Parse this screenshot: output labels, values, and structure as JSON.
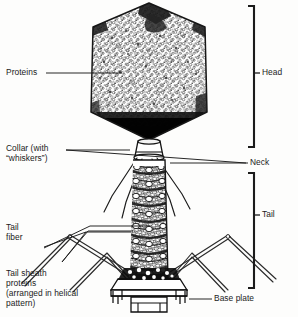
{
  "figure": {
    "style": "black-and-white stippled line drawing",
    "background_color": "#fdfdfc",
    "ink_color": "#1b1b1b"
  },
  "labels": {
    "proteins": "Proteins",
    "collar_line1": "Collar (with",
    "collar_line2": "“whiskers”)",
    "tail_fiber_line1": "Tail",
    "tail_fiber_line2": "fiber",
    "tail_sheath_line1": "Tail sheath",
    "tail_sheath_line2": "proteins",
    "tail_sheath_line3": "(arranged in helical",
    "tail_sheath_line4": "pattern)",
    "head": "Head",
    "neck": "Neck",
    "tail": "Tail",
    "base_plate": "Base plate"
  },
  "parts": {
    "head_capsid": "head-capsid",
    "collar": "collar",
    "whiskers": "whiskers",
    "tail_sheath": "tail-sheath",
    "tail_fiber_left_outer": "tail-fiber-left-outer",
    "tail_fiber_left_inner": "tail-fiber-left-inner",
    "tail_fiber_right_outer": "tail-fiber-right-outer",
    "tail_fiber_right_inner": "tail-fiber-right-inner",
    "base_plate": "base-plate",
    "tail_pins": "tail-pins"
  },
  "brackets": {
    "head": {
      "label": "Head",
      "top": 5,
      "bottom": 148,
      "tick": 73
    },
    "tail": {
      "label": "Tail",
      "top": 172,
      "bottom": 289,
      "tick": 215
    }
  },
  "leaders": {
    "proteins": {
      "from": [
        46,
        73
      ],
      "to": [
        122,
        73
      ]
    },
    "collar": {
      "from": [
        66,
        150
      ],
      "to": [
        252,
        163
      ]
    },
    "tail_sheath": {
      "from": [
        62,
        262
      ],
      "to": [
        152,
        233
      ]
    },
    "tail_fiber": {
      "from": [
        44,
        246
      ],
      "to": [
        140,
        233
      ]
    },
    "base_plate": {
      "from": [
        212,
        299
      ],
      "to": [
        186,
        299
      ]
    }
  }
}
